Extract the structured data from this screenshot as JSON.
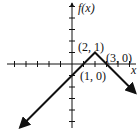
{
  "chart_data": {
    "type": "line",
    "title": "",
    "xlabel": "x",
    "ylabel": "f(x)",
    "xlim": [
      -6,
      5.5
    ],
    "ylim": [
      -5.5,
      5.5
    ],
    "x_ticks": [
      -5,
      -4,
      -3,
      -2,
      -1,
      1,
      2,
      3,
      4,
      5
    ],
    "y_ticks": [
      -5,
      -4,
      -3,
      -2,
      -1,
      1,
      2,
      3,
      4,
      5
    ],
    "grid": false,
    "series": [
      {
        "name": "f(x)",
        "points": [
          [
            -4.5,
            -5.5
          ],
          [
            2,
            1
          ],
          [
            5.5,
            -2.5
          ]
        ],
        "arrows_at_ends": true
      }
    ],
    "annotations": [
      {
        "text": "(2, 1)",
        "point": [
          2,
          1
        ]
      },
      {
        "text": "(3, 0)",
        "point": [
          3,
          0
        ]
      },
      {
        "text": "(1, 0)",
        "point": [
          1,
          0
        ]
      }
    ]
  },
  "labels": {
    "y_axis": "f(x)",
    "x_axis": "x",
    "peak": "(2, 1)",
    "root_right": "(3, 0)",
    "root_left": "(1, 0)"
  },
  "colors": {
    "ink": "#111111"
  }
}
